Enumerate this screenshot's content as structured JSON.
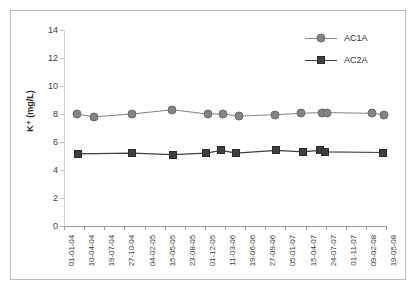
{
  "chart_data": {
    "type": "line",
    "title": "",
    "xlabel": "",
    "ylabel": "K⁺ (mg/L)",
    "ylim": [
      0,
      14
    ],
    "yticks": [
      0,
      2,
      4,
      6,
      8,
      10,
      12,
      14
    ],
    "grid": false,
    "legend_position": "top-right",
    "categories": [
      "01-01-04",
      "10-04-04",
      "19-07-04",
      "27-10-04",
      "04-02-05",
      "15-05-05",
      "23-08-05",
      "01-12-05",
      "11-03-06",
      "19-06-06",
      "27-09-06",
      "05-01-07",
      "15-04-07",
      "24-07-07",
      "01-11-07",
      "09-02-08",
      "19-05-08"
    ],
    "series": [
      {
        "name": "AC1A",
        "marker": "circle",
        "color": "#848484",
        "points": [
          {
            "x": 0.63,
            "y": 8.0
          },
          {
            "x": 1.48,
            "y": 7.8
          },
          {
            "x": 3.37,
            "y": 8.0
          },
          {
            "x": 5.37,
            "y": 8.3
          },
          {
            "x": 7.15,
            "y": 8.0
          },
          {
            "x": 7.9,
            "y": 8.0
          },
          {
            "x": 8.7,
            "y": 7.85
          },
          {
            "x": 10.5,
            "y": 7.95
          },
          {
            "x": 11.8,
            "y": 8.05
          },
          {
            "x": 12.8,
            "y": 8.1
          },
          {
            "x": 13.05,
            "y": 8.1
          },
          {
            "x": 15.3,
            "y": 8.05
          },
          {
            "x": 15.9,
            "y": 7.95
          }
        ]
      },
      {
        "name": "AC2A",
        "marker": "square",
        "color": "#3f3f3f",
        "points": [
          {
            "x": 0.68,
            "y": 5.15
          },
          {
            "x": 3.38,
            "y": 5.2
          },
          {
            "x": 5.4,
            "y": 5.1
          },
          {
            "x": 7.06,
            "y": 5.2
          },
          {
            "x": 7.81,
            "y": 5.4
          },
          {
            "x": 8.56,
            "y": 5.2
          },
          {
            "x": 10.55,
            "y": 5.4
          },
          {
            "x": 11.88,
            "y": 5.3
          },
          {
            "x": 12.7,
            "y": 5.4
          },
          {
            "x": 12.95,
            "y": 5.3
          },
          {
            "x": 15.85,
            "y": 5.25
          }
        ]
      }
    ]
  },
  "legend": {
    "entries": [
      {
        "label": "AC1A"
      },
      {
        "label": "AC2A"
      }
    ]
  }
}
